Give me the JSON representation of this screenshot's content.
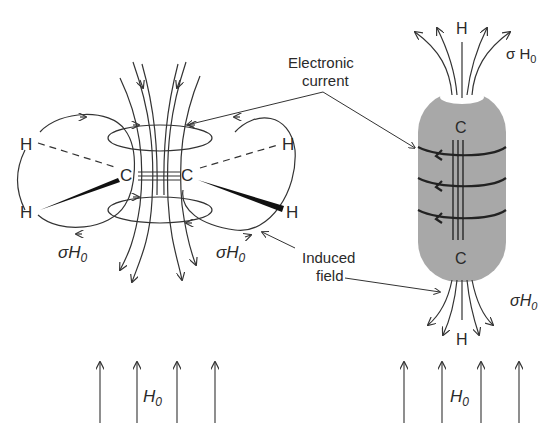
{
  "left_molecule": {
    "atoms": {
      "h_top_left": "H",
      "h_bottom_left": "H",
      "c_left": "C",
      "c_right": "C",
      "h_top_right": "H",
      "h_bottom_right": "H"
    },
    "sigma_left": "σH",
    "sigma_left_sub": "0",
    "sigma_right": "σH",
    "sigma_right_sub": "0"
  },
  "right_molecule": {
    "h_top": "H",
    "h_bottom": "H",
    "c_top": "C",
    "c_bottom": "C",
    "sigma_top": "σ H",
    "sigma_top_sub": "0",
    "sigma_bottom": "σH",
    "sigma_bottom_sub": "0",
    "cylinder_color": "#a8a8a8"
  },
  "labels": {
    "electronic_line1": "Electronic",
    "electronic_line2": "current",
    "induced_line1": "Induced",
    "induced_line2": "field"
  },
  "applied_field": {
    "left_label": "H",
    "left_sub": "0",
    "right_label": "H",
    "right_sub": "0"
  }
}
